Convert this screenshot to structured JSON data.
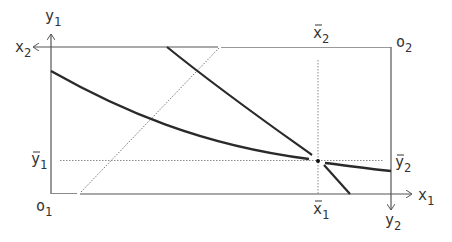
{
  "diagram": {
    "type": "edgeworth-box",
    "colors": {
      "axis": "#555555",
      "curve": "#2a2a2a",
      "dotted": "#8a8a8a",
      "text": "#333333",
      "background": "#ffffff"
    },
    "labels": {
      "y1": {
        "base": "y",
        "sub": "1"
      },
      "x2": {
        "base": "x",
        "sub": "2"
      },
      "o1": {
        "base": "o",
        "sub": "1"
      },
      "o2": {
        "base": "o",
        "sub": "2"
      },
      "x1": {
        "base": "x",
        "sub": "1"
      },
      "y2": {
        "base": "y",
        "sub": "2"
      },
      "x1bar": {
        "base": "x",
        "sub": "1",
        "bar": true
      },
      "x2bar": {
        "base": "x",
        "sub": "2",
        "bar": true
      },
      "y1bar": {
        "base": "y",
        "sub": "1",
        "bar": true
      },
      "y2bar": {
        "base": "y",
        "sub": "2",
        "bar": true
      }
    },
    "elements": [
      "origin-1-axes (x1 right, y1 up)",
      "origin-2-axes (x2 left, y2 down)",
      "indifference-curve-agent-1 (convex, through endowment)",
      "indifference-curve-agent-2 (steep, through endowment)",
      "endowment-point at (x1bar, y1bar)",
      "dotted diagonal line"
    ]
  }
}
